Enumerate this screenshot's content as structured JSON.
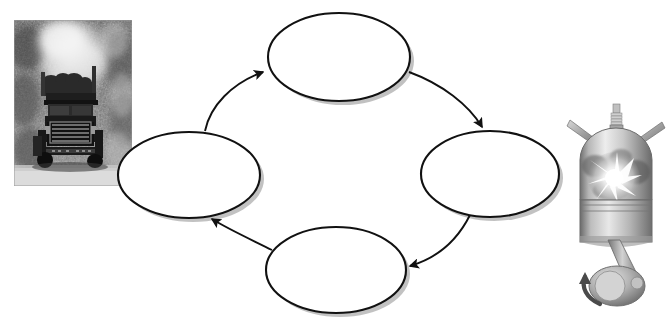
{
  "diagram": {
    "type": "cycle-diagram",
    "title": "",
    "orientation": "counterclockwise",
    "node_count": 4,
    "nodes": [
      {
        "id": "node-top",
        "label": "",
        "cx": 339,
        "cy": 57,
        "rx": 71,
        "ry": 44
      },
      {
        "id": "node-right",
        "label": "",
        "cx": 490,
        "cy": 174,
        "rx": 69,
        "ry": 43
      },
      {
        "id": "node-bottom",
        "label": "",
        "cx": 336,
        "cy": 270,
        "rx": 70,
        "ry": 43
      },
      {
        "id": "node-left",
        "label": "",
        "cx": 189,
        "cy": 175,
        "rx": 71,
        "ry": 43
      }
    ],
    "arrows": [
      {
        "id": "arrow-left-to-top",
        "from": "node-left",
        "to": "node-top",
        "label": ""
      },
      {
        "id": "arrow-top-to-right",
        "from": "node-top",
        "to": "node-right",
        "label": ""
      },
      {
        "id": "arrow-right-to-bottom",
        "from": "node-right",
        "to": "node-bottom",
        "label": ""
      },
      {
        "id": "arrow-bottom-to-left",
        "from": "node-bottom",
        "to": "node-left",
        "label": ""
      }
    ],
    "colors": {
      "node_fill": "#ffffff",
      "node_stroke": "#111111",
      "arrow_stroke": "#111111",
      "shadow": "#b9b9b9",
      "background": "#ffffff"
    }
  },
  "photo": {
    "name": "logging-truck-photo",
    "caption": "",
    "style": "black-and-white photograph",
    "subject": "logging truck on dirt road emitting exhaust smoke",
    "x": 14,
    "y": 20,
    "width": 118,
    "height": 166
  },
  "illustration": {
    "name": "engine-piston-illustration",
    "caption": "",
    "style": "grayscale technical illustration",
    "subject": "engine cylinder with spark plug, valves, piston, connecting rod and crankshaft during combustion",
    "x": 568,
    "y": 104,
    "width": 96,
    "height": 214,
    "parts": [
      "spark-plug",
      "intake-valve",
      "exhaust-valve",
      "combustion-flame",
      "piston",
      "connecting-rod",
      "crankshaft",
      "rotation-arrow"
    ]
  }
}
